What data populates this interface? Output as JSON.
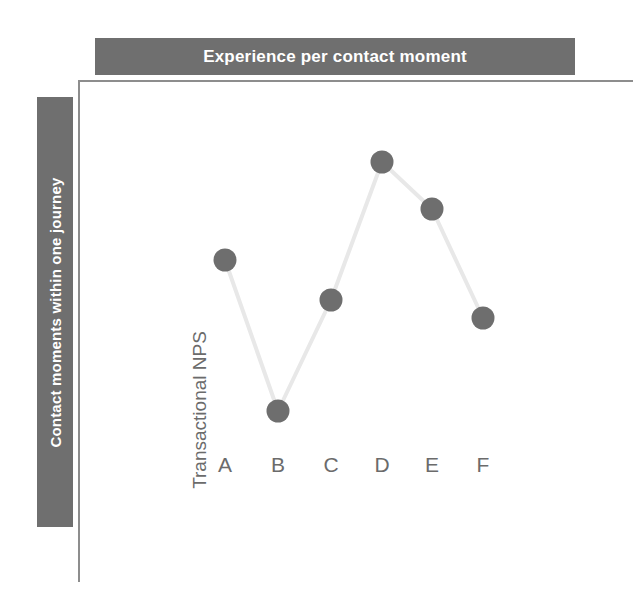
{
  "banners": {
    "top": "Experience per contact moment",
    "left": "Contact moments within one journey"
  },
  "colors": {
    "banner_gray": "#6f6f6f",
    "marker_gray": "#6e6e6e",
    "line_gray": "#e8e8e8",
    "border_gray": "#8d8d8d",
    "label_gray": "#6b6b6b",
    "background": "#ffffff"
  },
  "chart_data": {
    "type": "line",
    "title": "",
    "xlabel": "",
    "ylabel": "Transactional NPS",
    "categories": [
      "A",
      "B",
      "C",
      "D",
      "E",
      "F"
    ],
    "values": [
      60,
      0,
      44,
      100,
      84,
      49
    ],
    "ylim": [
      0,
      100
    ],
    "grid": false,
    "legend": "none",
    "axis_ticks_shown": false,
    "series": [
      {
        "name": "Transactional NPS",
        "values": [
          60,
          0,
          44,
          100,
          84,
          49
        ]
      }
    ],
    "points_px": [
      {
        "label": "A",
        "x": 225,
        "y": 260
      },
      {
        "label": "B",
        "x": 278,
        "y": 411
      },
      {
        "label": "C",
        "x": 331,
        "y": 300
      },
      {
        "label": "D",
        "x": 382,
        "y": 162
      },
      {
        "label": "E",
        "x": 432,
        "y": 209
      },
      {
        "label": "F",
        "x": 483,
        "y": 318
      }
    ]
  }
}
